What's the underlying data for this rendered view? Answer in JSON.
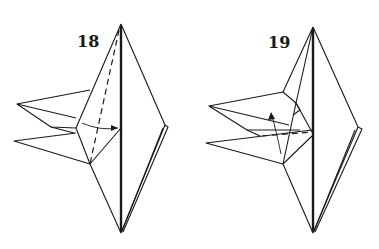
{
  "diagram": {
    "type": "origami-instruction",
    "steps": [
      {
        "number": "18",
        "description": "Valley fold flap along dashed line toward center",
        "arrow": "fold-in"
      },
      {
        "number": "19",
        "description": "Fold flap upward",
        "arrow": "curved-up"
      }
    ],
    "colors": {
      "ink": "#1a1a1a",
      "paper": "#ffffff"
    }
  }
}
